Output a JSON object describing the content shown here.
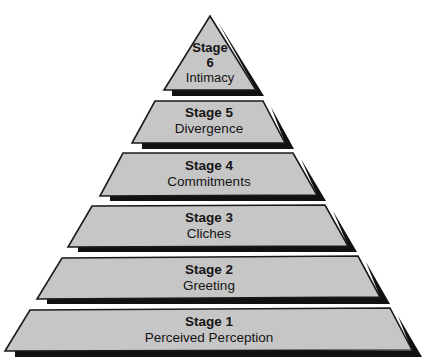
{
  "diagram": {
    "type": "pyramid",
    "colors": {
      "fill": "#c6c6c6",
      "shadow": "#111111",
      "outline": "#1a1a1a",
      "background": "#ffffff"
    },
    "tiers": [
      {
        "stage": "Stage 1",
        "name": "Perceived Perception"
      },
      {
        "stage": "Stage 2",
        "name": "Greeting"
      },
      {
        "stage": "Stage 3",
        "name": "Cliches"
      },
      {
        "stage": "Stage 4",
        "name": "Commitments"
      },
      {
        "stage": "Stage 5",
        "name": "Divergence"
      },
      {
        "stage_word": "Stage",
        "stage_num": "6",
        "name": "Intimacy"
      }
    ]
  }
}
